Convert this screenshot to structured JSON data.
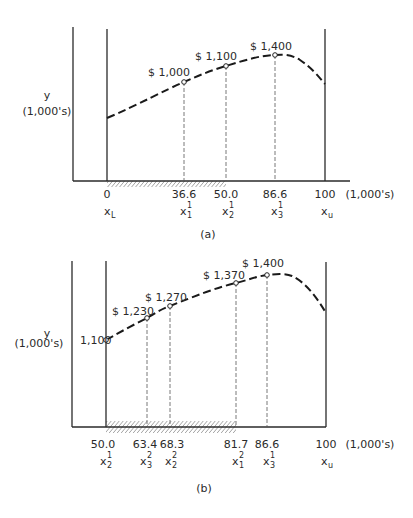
{
  "panels": [
    {
      "id": "a",
      "caption": "(a)",
      "y_label_1": "y",
      "y_label_2": "(1,000's)",
      "x_unit": "(1,000's)",
      "ticks": [
        {
          "value": "0",
          "var": "x",
          "sub": "L",
          "sup": ""
        },
        {
          "value": "36.6",
          "var": "x",
          "sub": "1",
          "sup": "1"
        },
        {
          "value": "50.0",
          "var": "x",
          "sub": "2",
          "sup": "1"
        },
        {
          "value": "86.6",
          "var": "x",
          "sub": "3",
          "sup": "1"
        },
        {
          "value": "100",
          "var": "x",
          "sub": "u",
          "sup": ""
        }
      ],
      "points": [
        {
          "label": "$ 1,000",
          "x": 36.6
        },
        {
          "label": "$ 1,100",
          "x": 50.0
        },
        {
          "label": "$ 1,400",
          "x": 86.6
        }
      ],
      "interval": "0 – 50.0 (hatched)"
    },
    {
      "id": "b",
      "caption": "(b)",
      "y_label_1": "y",
      "y_label_2": "(1,000's)",
      "x_unit": "(1,000's)",
      "start_value": "1,100",
      "ticks": [
        {
          "value": "50.0",
          "var": "x",
          "sub": "2",
          "sup": "1"
        },
        {
          "value": "63.4",
          "var": "x",
          "sub": "3",
          "sup": "2"
        },
        {
          "value": "68.3",
          "var": "x",
          "sub": "2",
          "sup": "2"
        },
        {
          "value": "81.7",
          "var": "x",
          "sub": "1",
          "sup": "2"
        },
        {
          "value": "86.6",
          "var": "x",
          "sub": "3",
          "sup": "1"
        },
        {
          "value": "100",
          "var": "x",
          "sub": "u",
          "sup": ""
        }
      ],
      "points": [
        {
          "label": "$ 1,230",
          "x": 63.4
        },
        {
          "label": "$ 1,270",
          "x": 68.3
        },
        {
          "label": "$ 1,370",
          "x": 81.7
        },
        {
          "label": "$ 1,400",
          "x": 86.6
        }
      ],
      "interval": "50.0 – 81.7 (hatched)"
    }
  ]
}
